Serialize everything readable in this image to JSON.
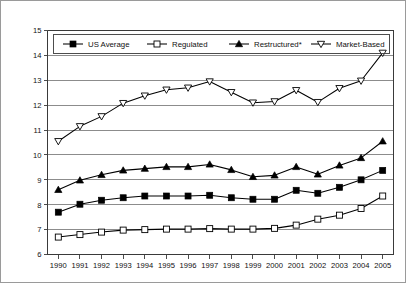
{
  "chart_data": {
    "type": "line",
    "title": "",
    "subtitle": "",
    "xlabel": "",
    "ylabel": "",
    "grid": true,
    "legend_position": "top-inside",
    "x": [
      "1990",
      "1991",
      "1992",
      "1993",
      "1994",
      "1995",
      "1996",
      "1997",
      "1998",
      "1999",
      "2000",
      "2001",
      "2002",
      "2003",
      "2004",
      "2005"
    ],
    "categories": [
      "1990",
      "1991",
      "1992",
      "1993",
      "1994",
      "1995",
      "1996",
      "1997",
      "1998",
      "1999",
      "2000",
      "2001",
      "2002",
      "2003",
      "2004",
      "2005"
    ],
    "ylim": [
      6,
      15
    ],
    "ytick_labels": [
      "6",
      "7",
      "8",
      "9",
      "10",
      "11",
      "12",
      "13",
      "14",
      "15"
    ],
    "ytick_values": [
      6,
      7,
      8,
      9,
      10,
      11,
      12,
      13,
      14,
      15
    ],
    "series": [
      {
        "name": "US Average",
        "marker": "filled-square",
        "values": [
          7.7,
          8.02,
          8.18,
          8.28,
          8.35,
          8.35,
          8.35,
          8.38,
          8.28,
          8.22,
          8.22,
          8.58,
          8.46,
          8.7,
          9.0,
          9.38
        ]
      },
      {
        "name": "Regulated",
        "marker": "open-square",
        "values": [
          6.7,
          6.8,
          6.9,
          6.98,
          7.0,
          7.02,
          7.02,
          7.04,
          7.02,
          7.02,
          7.05,
          7.18,
          7.42,
          7.58,
          7.85,
          8.35
        ]
      },
      {
        "name": "Restructured*",
        "marker": "filled-triangle",
        "values": [
          8.6,
          8.98,
          9.2,
          9.38,
          9.45,
          9.52,
          9.52,
          9.62,
          9.4,
          9.12,
          9.18,
          9.52,
          9.22,
          9.58,
          9.88,
          10.55
        ]
      },
      {
        "name": "Market-Based",
        "marker": "open-triangle-down",
        "values": [
          10.55,
          11.15,
          11.55,
          12.08,
          12.38,
          12.62,
          12.7,
          12.95,
          12.52,
          12.1,
          12.15,
          12.6,
          12.12,
          12.68,
          12.98,
          14.1
        ]
      }
    ],
    "legend": [
      {
        "label": "US Average",
        "marker": "filled-square"
      },
      {
        "label": "Regulated",
        "marker": "open-square"
      },
      {
        "label": "Restructured*",
        "marker": "filled-triangle"
      },
      {
        "label": "Market-Based",
        "marker": "open-triangle-down"
      }
    ],
    "colors": {
      "series_stroke": "#000000",
      "grid": "#6f6f6f",
      "axis": "#3a3a3a",
      "background": "#ffffff"
    }
  }
}
